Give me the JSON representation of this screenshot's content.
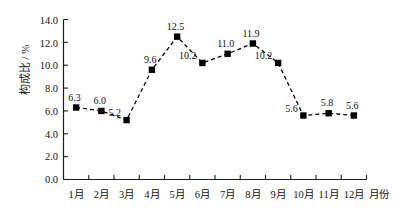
{
  "chart_data": {
    "type": "line",
    "title": "",
    "subtitle": "",
    "xlabel": "月份",
    "ylabel": "构成比 / %",
    "categories": [
      "1月",
      "2月",
      "3月",
      "4月",
      "5月",
      "6月",
      "7月",
      "8月",
      "9月",
      "10月",
      "11月",
      "12月"
    ],
    "values": [
      6.3,
      6.0,
      5.2,
      9.6,
      12.5,
      10.2,
      11.0,
      11.9,
      10.2,
      5.6,
      5.8,
      5.6
    ],
    "point_labels": [
      "6.3",
      "6.0",
      "5.2",
      "9.6",
      "12.5",
      "10.2",
      "11.0",
      "11.9",
      "10.2",
      "5.6",
      "5.8",
      "5.6"
    ],
    "ylim": [
      0.0,
      14.0
    ],
    "ytick_step": 2.0,
    "ytick_labels": [
      "14.0",
      "12.0",
      "10.0",
      "8.0",
      "6.0",
      "4.0",
      "2.0",
      "0.0"
    ],
    "ytick_values": [
      14.0,
      12.0,
      10.0,
      8.0,
      6.0,
      4.0,
      2.0,
      0.0
    ],
    "grid": false,
    "legend": false,
    "legend_position": "none",
    "marker": "filled-square",
    "line_style": "dashed",
    "series_color": "#000000",
    "axis_color": "#1a1a1a",
    "background_color": "#ffffff"
  }
}
